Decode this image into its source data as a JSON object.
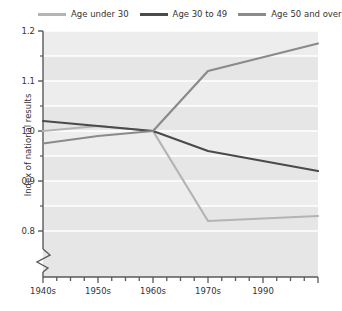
{
  "legend": {
    "position": "top",
    "entries": [
      {
        "label": "Age under 30",
        "color": "#b4b4b4",
        "icon": "line-swatch-icon"
      },
      {
        "label": "Age 30 to 49",
        "color": "#4a4a4a",
        "icon": "line-swatch-icon"
      },
      {
        "label": "Age 50 and over",
        "color": "#8a8a8a",
        "icon": "line-swatch-icon"
      }
    ]
  },
  "axes": {
    "ylabel": "Index of national results",
    "xlabel": "",
    "y_ticks": [
      "1.2",
      "1.1",
      "1.0",
      "0.9",
      "0.8"
    ],
    "y_tick_values": [
      1.2,
      1.1,
      1.0,
      0.9,
      0.8
    ],
    "y_minor_values": [
      1.15,
      1.05,
      0.95,
      0.85
    ],
    "x_ticks": [
      "1940s",
      "1950s",
      "1960s",
      "1970s",
      "1990"
    ],
    "axis_break": "zigzag-break-icon"
  },
  "chart_data": {
    "type": "line",
    "title": "",
    "subtitle": "",
    "xlabel": "",
    "ylabel": "Index of national results",
    "categories": [
      "1940s",
      "1950s",
      "1960s",
      "1970s",
      "1990"
    ],
    "x": [
      1940,
      1950,
      1960,
      1970,
      1990
    ],
    "xlim": [
      1940,
      1990
    ],
    "ylim": [
      0.78,
      1.2
    ],
    "y_ticks": [
      0.8,
      0.9,
      1.0,
      1.1,
      1.2
    ],
    "grid": true,
    "grid_orientation": "horizontal",
    "legend_position": "top",
    "y_axis_broken": true,
    "series": [
      {
        "name": "Age under 30",
        "color": "#b4b4b4",
        "values": [
          1.0,
          1.01,
          1.0,
          0.82,
          0.83
        ]
      },
      {
        "name": "Age 30 to 49",
        "color": "#4a4a4a",
        "values": [
          1.02,
          1.01,
          1.0,
          0.96,
          0.92
        ]
      },
      {
        "name": "Age 50 and over",
        "color": "#8a8a8a",
        "values": [
          0.975,
          0.99,
          1.0,
          1.12,
          1.175
        ]
      }
    ],
    "annotations": []
  },
  "style": {
    "plot_background": "#ededed",
    "band_background": "#e6e6e6",
    "gridline_color": "#ffffff",
    "axis_color": "#595959",
    "page_background": "#ffffff"
  }
}
